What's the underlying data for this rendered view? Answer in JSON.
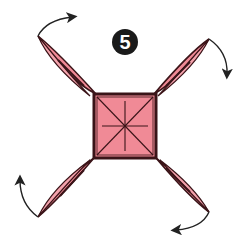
{
  "diagram": {
    "type": "origami-step",
    "step_number": "5",
    "colors": {
      "paper_fill": "#f08a96",
      "outline": "#3a1418",
      "arrow": "#222222",
      "background": "#ffffff"
    },
    "center_square": {
      "x": 94,
      "y": 94,
      "width": 62,
      "height": 64,
      "creases": [
        "diagonal-a",
        "diagonal-b",
        "vertical",
        "horizontal"
      ]
    },
    "flaps": [
      {
        "position": "top-left",
        "tip": [
          38,
          36
        ],
        "arrow_direction": "clockwise-up-right"
      },
      {
        "position": "top-right",
        "tip": [
          209,
          39
        ],
        "arrow_direction": "down"
      },
      {
        "position": "bottom-left",
        "tip": [
          38,
          217
        ],
        "arrow_direction": "up"
      },
      {
        "position": "bottom-right",
        "tip": [
          209,
          212
        ],
        "arrow_direction": "left"
      }
    ]
  }
}
